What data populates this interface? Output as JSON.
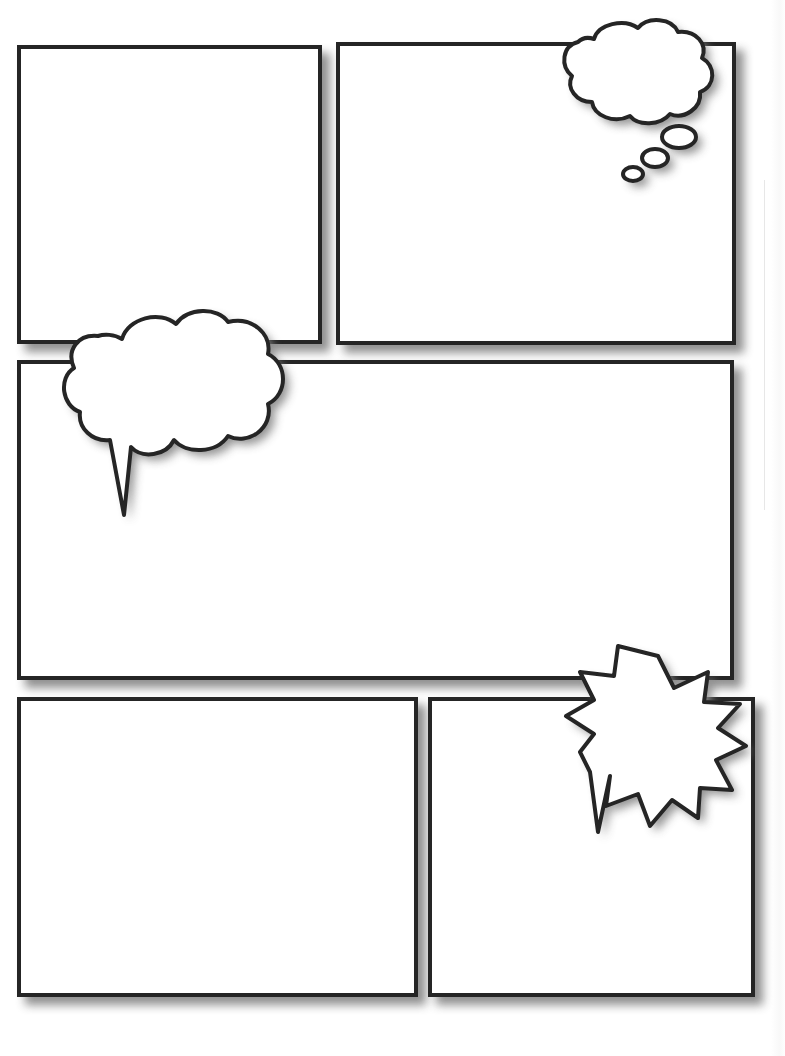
{
  "document": {
    "title": "Blank Comic Page Template",
    "page_width": 785,
    "page_height": 1056,
    "background_color": "#ffffff",
    "ink_color": "#252525",
    "fill_color": "#ffffff",
    "shadow_color": "#808080",
    "border_width_px": 4
  },
  "panels": [
    {
      "id": "panel-1",
      "label": "",
      "row": 1,
      "position": "top-left",
      "x": 17,
      "y": 45,
      "width": 305,
      "height": 299
    },
    {
      "id": "panel-2",
      "label": "",
      "row": 1,
      "position": "top-right",
      "x": 336,
      "y": 42,
      "width": 400,
      "height": 303
    },
    {
      "id": "panel-3",
      "label": "",
      "row": 2,
      "position": "middle-wide",
      "x": 17,
      "y": 360,
      "width": 717,
      "height": 320
    },
    {
      "id": "panel-4",
      "label": "",
      "row": 3,
      "position": "bottom-left",
      "x": 17,
      "y": 697,
      "width": 401,
      "height": 300
    },
    {
      "id": "panel-5",
      "label": "",
      "row": 3,
      "position": "bottom-right",
      "x": 428,
      "y": 697,
      "width": 327,
      "height": 300
    }
  ],
  "balloons": [
    {
      "id": "thought-bubble-1",
      "type": "thought",
      "text": "",
      "in_panel": "panel-2",
      "x": 568,
      "y": 29,
      "width": 146,
      "height": 98,
      "tail_direction": "down-left",
      "tail_dot_count": 3
    },
    {
      "id": "speech-bubble-1",
      "type": "speech-cloud",
      "text": "",
      "in_panel": "panel-3",
      "x": 70,
      "y": 316,
      "width": 204,
      "height": 148,
      "tail_direction": "down-left",
      "tail_tip_x": 117,
      "tail_tip_y": 516
    },
    {
      "id": "burst-bubble-1",
      "type": "burst",
      "text": "",
      "in_panel": "panel-5",
      "x": 570,
      "y": 650,
      "width": 158,
      "height": 136,
      "spike_count": 12,
      "tail_direction": "down-left",
      "tail_tip_x": 590,
      "tail_tip_y": 813
    }
  ]
}
